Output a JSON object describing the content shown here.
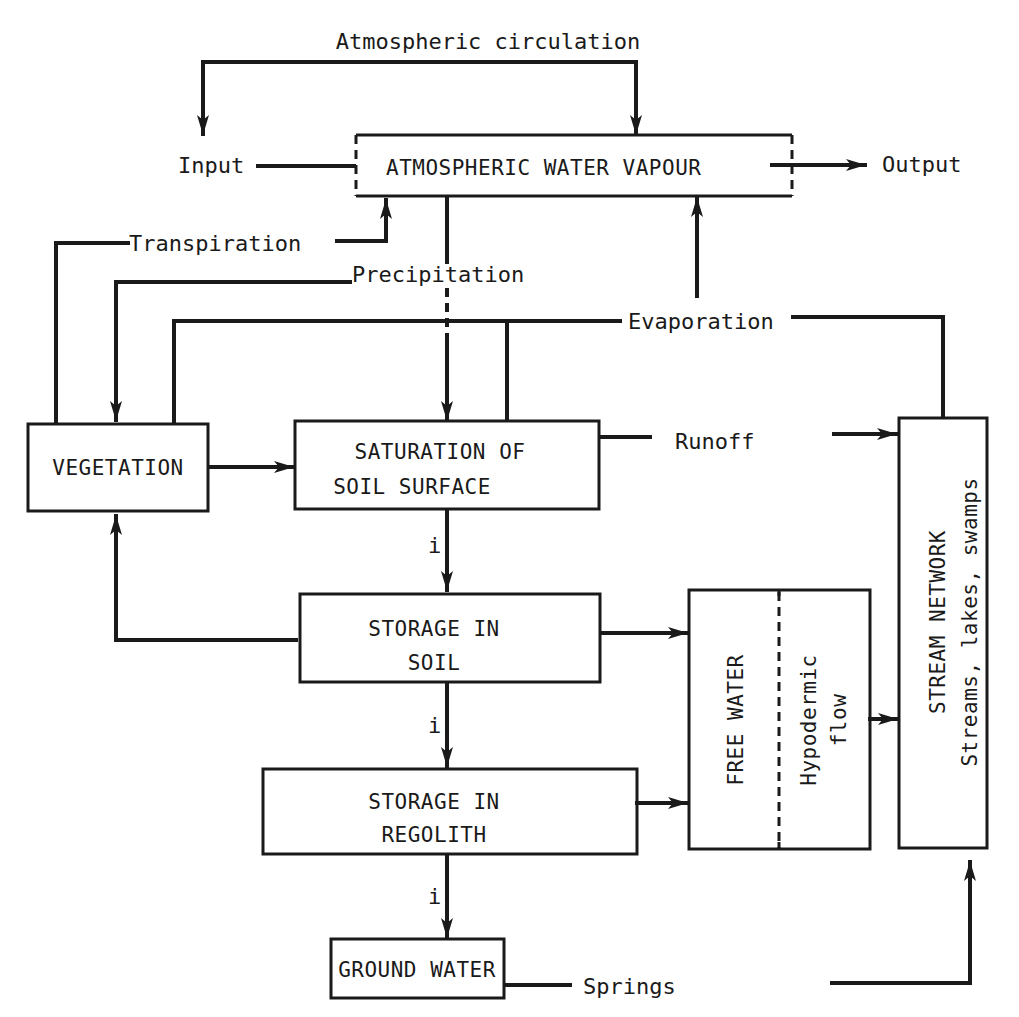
{
  "diagram": {
    "type": "flow diagram",
    "top_flow": {
      "circulation_label": "Atmospheric circulation",
      "input_label": "Input",
      "output_label": "Output"
    },
    "nodes": {
      "atmosphere": "ATMOSPHERIC WATER VAPOUR",
      "vegetation": "VEGETATION",
      "saturation_line1": "SATURATION OF",
      "saturation_line2": "SOIL SURFACE",
      "soil_line1": "STORAGE IN",
      "soil_line2": "SOIL",
      "regolith_line1": "STORAGE IN",
      "regolith_line2": "REGOLITH",
      "groundwater": "GROUND WATER",
      "free_water": "FREE WATER",
      "hypodermic_line1": "Hypodermic",
      "hypodermic_line2": "flow",
      "stream_line1": "STREAM NETWORK",
      "stream_line2": "Streams, lakes, swamps"
    },
    "flows": {
      "transpiration": "Transpiration",
      "precipitation": "Precipitation",
      "evaporation": "Evaporation",
      "runoff": "Runoff",
      "springs": "Springs",
      "infiltration_1": "i",
      "infiltration_2": "i",
      "infiltration_3": "i"
    },
    "edges": [
      {
        "from": "Input",
        "to": "ATMOSPHERIC WATER VAPOUR"
      },
      {
        "from": "ATMOSPHERIC WATER VAPOUR",
        "to": "Output"
      },
      {
        "from": "Atmospheric circulation",
        "to": "Input"
      },
      {
        "from": "Atmospheric circulation",
        "to": "Output"
      },
      {
        "from": "VEGETATION",
        "to": "ATMOSPHERIC WATER VAPOUR",
        "label": "Transpiration"
      },
      {
        "from": "ATMOSPHERIC WATER VAPOUR",
        "to": "VEGETATION",
        "label": "Precipitation"
      },
      {
        "from": "ATMOSPHERIC WATER VAPOUR",
        "to": "SATURATION OF SOIL SURFACE",
        "label": "Precipitation"
      },
      {
        "from": "VEGETATION",
        "to": "ATMOSPHERIC WATER VAPOUR",
        "label": "Evaporation"
      },
      {
        "from": "SATURATION OF SOIL SURFACE",
        "to": "ATMOSPHERIC WATER VAPOUR",
        "label": "Evaporation"
      },
      {
        "from": "STREAM NETWORK",
        "to": "ATMOSPHERIC WATER VAPOUR",
        "label": "Evaporation"
      },
      {
        "from": "VEGETATION",
        "to": "SATURATION OF SOIL SURFACE"
      },
      {
        "from": "SATURATION OF SOIL SURFACE",
        "to": "STREAM NETWORK",
        "label": "Runoff"
      },
      {
        "from": "SATURATION OF SOIL SURFACE",
        "to": "STORAGE IN SOIL",
        "label": "i"
      },
      {
        "from": "STORAGE IN SOIL",
        "to": "VEGETATION"
      },
      {
        "from": "STORAGE IN SOIL",
        "to": "FREE WATER"
      },
      {
        "from": "STORAGE IN SOIL",
        "to": "STORAGE IN REGOLITH",
        "label": "i"
      },
      {
        "from": "STORAGE IN REGOLITH",
        "to": "FREE WATER"
      },
      {
        "from": "STORAGE IN REGOLITH",
        "to": "GROUND WATER",
        "label": "i"
      },
      {
        "from": "Hypodermic flow",
        "to": "STREAM NETWORK"
      },
      {
        "from": "GROUND WATER",
        "to": "STREAM NETWORK",
        "label": "Springs"
      }
    ]
  }
}
